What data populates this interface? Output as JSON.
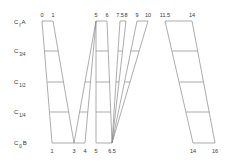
{
  "diagram": {
    "row_labels": [
      {
        "main": "C",
        "sub": "f",
        "suffix": "A",
        "y": 22
      },
      {
        "main": "C",
        "sub": "3/4",
        "suffix": "",
        "y": 51
      },
      {
        "main": "C",
        "sub": "1/2",
        "suffix": "",
        "y": 82
      },
      {
        "main": "C",
        "sub": "1/4",
        "suffix": "",
        "y": 112
      },
      {
        "main": "C",
        "sub": "0",
        "suffix": "B",
        "y": 143
      }
    ],
    "top_ticks": [
      {
        "label": "0",
        "x": 42
      },
      {
        "label": "1",
        "x": 53
      },
      {
        "label": "5",
        "x": 96
      },
      {
        "label": "6",
        "x": 107
      },
      {
        "label": "7.5",
        "x": 120
      },
      {
        "label": "8",
        "x": 126
      },
      {
        "label": "9",
        "x": 137
      },
      {
        "label": "10",
        "x": 148
      },
      {
        "label": "11.5",
        "x": 165
      },
      {
        "label": "14",
        "x": 192
      }
    ],
    "bottom_ticks": [
      {
        "label": "1",
        "x": 52
      },
      {
        "label": "3",
        "x": 74
      },
      {
        "label": "4",
        "x": 85
      },
      {
        "label": "5",
        "x": 96
      },
      {
        "label": "6.5",
        "x": 112
      },
      {
        "label": "14",
        "x": 193
      },
      {
        "label": "16",
        "x": 215
      }
    ],
    "levels": {
      "top": 21,
      "q3": 51,
      "half": 82,
      "q1": 112,
      "bottom": 143
    },
    "line_color": "#888888",
    "text_color": "#333333"
  }
}
